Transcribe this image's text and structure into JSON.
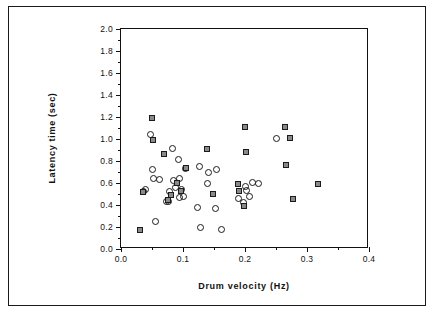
{
  "chart_data": {
    "type": "scatter",
    "title": "",
    "xlabel": "Drum  velocity  (Hz)",
    "ylabel": "Latency  time  (sec)",
    "xlim": [
      0.0,
      0.4
    ],
    "ylim": [
      0.0,
      2.0
    ],
    "xticks": [
      0.0,
      0.1,
      0.2,
      0.3,
      0.4
    ],
    "xtick_labels": [
      "0.0",
      "0.1",
      "0.2",
      "0.3",
      "0.4"
    ],
    "yticks": [
      0.0,
      0.2,
      0.4,
      0.6,
      0.8,
      1.0,
      1.2,
      1.4,
      1.6,
      1.8,
      2.0
    ],
    "ytick_labels": [
      "0.0",
      "0.2",
      "0.4",
      "0.6",
      "0.8",
      "1.0",
      "1.2",
      "1.4",
      "1.6",
      "1.8",
      "2.0"
    ],
    "x_minor_ticks": [
      0.05,
      0.15,
      0.25,
      0.35
    ],
    "y_minor_ticks": [
      0.1,
      0.3,
      0.5,
      0.7,
      0.9,
      1.1,
      1.3,
      1.5,
      1.7,
      1.9
    ],
    "grid": false,
    "legend": null,
    "series": [
      {
        "name": "open-circle-group",
        "marker": "circle",
        "marker_fill": "none",
        "marker_edge": "#1b1b1b",
        "points": [
          [
            0.037,
            0.525
          ],
          [
            0.04,
            0.545
          ],
          [
            0.048,
            1.04
          ],
          [
            0.05,
            0.72
          ],
          [
            0.053,
            0.64
          ],
          [
            0.055,
            0.25
          ],
          [
            0.062,
            0.63
          ],
          [
            0.073,
            0.435
          ],
          [
            0.076,
            0.43
          ],
          [
            0.078,
            0.52
          ],
          [
            0.083,
            0.91
          ],
          [
            0.084,
            0.62
          ],
          [
            0.088,
            0.555
          ],
          [
            0.093,
            0.81
          ],
          [
            0.094,
            0.64
          ],
          [
            0.095,
            0.47
          ],
          [
            0.097,
            0.54
          ],
          [
            0.1,
            0.475
          ],
          [
            0.104,
            0.735
          ],
          [
            0.124,
            0.375
          ],
          [
            0.126,
            0.75
          ],
          [
            0.128,
            0.195
          ],
          [
            0.139,
            0.6
          ],
          [
            0.141,
            0.695
          ],
          [
            0.152,
            0.365
          ],
          [
            0.154,
            0.72
          ],
          [
            0.162,
            0.175
          ],
          [
            0.189,
            0.46
          ],
          [
            0.198,
            0.42
          ],
          [
            0.201,
            0.565
          ],
          [
            0.203,
            0.53
          ],
          [
            0.208,
            0.48
          ],
          [
            0.212,
            0.605
          ],
          [
            0.222,
            0.595
          ],
          [
            0.25,
            1.005
          ]
        ]
      },
      {
        "name": "filled-square-group",
        "marker": "square",
        "marker_fill": "#8a8a8a",
        "marker_edge": "#1b1b1b",
        "points": [
          [
            0.03,
            0.17
          ],
          [
            0.036,
            0.52
          ],
          [
            0.05,
            1.195
          ],
          [
            0.052,
            0.99
          ],
          [
            0.07,
            0.86
          ],
          [
            0.075,
            0.445
          ],
          [
            0.08,
            0.49
          ],
          [
            0.09,
            0.6
          ],
          [
            0.096,
            0.53
          ],
          [
            0.105,
            0.735
          ],
          [
            0.138,
            0.905
          ],
          [
            0.148,
            0.5
          ],
          [
            0.188,
            0.595
          ],
          [
            0.19,
            0.525
          ],
          [
            0.199,
            0.395
          ],
          [
            0.2,
            1.11
          ],
          [
            0.201,
            0.885
          ],
          [
            0.265,
            1.105
          ],
          [
            0.266,
            0.765
          ],
          [
            0.272,
            1.005
          ],
          [
            0.277,
            0.455
          ],
          [
            0.318,
            0.595
          ]
        ]
      }
    ]
  }
}
